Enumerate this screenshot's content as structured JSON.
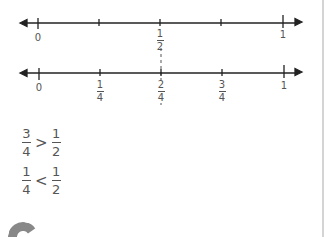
{
  "number_lines": [
    {
      "name": "halves",
      "labels": [
        {
          "pos": 0,
          "text": "0"
        },
        {
          "pos": 0.5,
          "num": "1",
          "den": "2"
        },
        {
          "pos": 1,
          "text": "1"
        }
      ],
      "ticks": [
        0,
        0.25,
        0.5,
        0.75,
        1
      ]
    },
    {
      "name": "quarters",
      "labels": [
        {
          "pos": 0,
          "text": "0"
        },
        {
          "pos": 0.25,
          "num": "1",
          "den": "4"
        },
        {
          "pos": 0.5,
          "num": "2",
          "den": "4"
        },
        {
          "pos": 0.75,
          "num": "3",
          "den": "4"
        },
        {
          "pos": 1,
          "text": "1"
        }
      ],
      "ticks": [
        0,
        0.25,
        0.5,
        0.75,
        1
      ]
    }
  ],
  "comparisons": [
    {
      "left": {
        "num": "3",
        "den": "4"
      },
      "op": ">",
      "right": {
        "num": "1",
        "den": "2"
      }
    },
    {
      "left": {
        "num": "1",
        "den": "4"
      },
      "op": "<",
      "right": {
        "num": "1",
        "den": "2"
      }
    }
  ],
  "colors": {
    "line": "#222222",
    "text": "#555555",
    "page_edge": "#d4d4d4",
    "decor": "#888888"
  }
}
